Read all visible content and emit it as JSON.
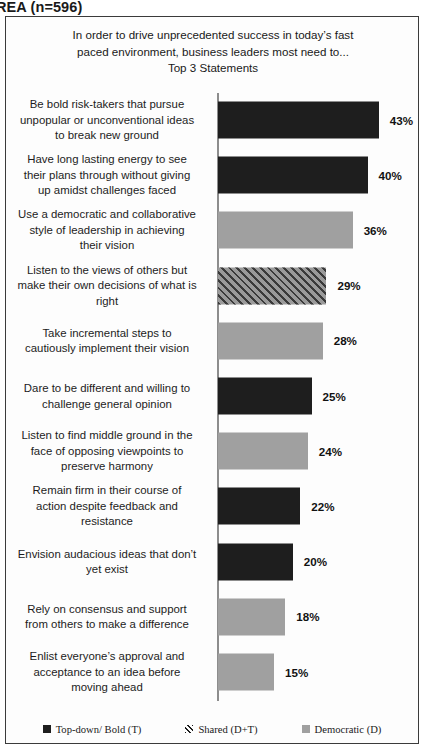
{
  "header": {
    "text": "REA (n=596)"
  },
  "chart_data": {
    "type": "bar",
    "orientation": "horizontal",
    "title_lines": [
      "In order to drive unprecedented success in today’s fast",
      "paced environment, business leaders most need to...",
      "Top 3 Statements"
    ],
    "xlabel": "",
    "ylabel": "",
    "xlim": [
      0,
      50
    ],
    "grid": false,
    "legend_position": "bottom",
    "value_suffix": "%",
    "categories": [
      "Be bold risk-takers  that pursue unpopular or unconventional ideas to break new ground",
      "Have long lasting energy to see their plans through without giving up amidst challenges faced",
      "Use a democratic and collaborative style of leadership  in achieving their vision",
      "Listen to the views of others but make their own decisions of what is right",
      "Take incremental steps to cautiously implement their vision",
      "Dare to be different and willing to challenge  general opinion",
      "Listen to find middle ground in the face of opposing viewpoints  to preserve harmony",
      "Remain firm in their course of action despite feedback and resistance",
      "Envision audacious ideas that don’t yet exist",
      "Rely on consensus and support from others to make a difference",
      "Enlist everyone’s approval and acceptance to an idea before moving ahead"
    ],
    "values": [
      43,
      40,
      36,
      29,
      28,
      25,
      24,
      22,
      20,
      18,
      15
    ],
    "value_labels": [
      "43%",
      "40%",
      "36%",
      "29%",
      "28%",
      "25%",
      "24%",
      "22%",
      "20%",
      "18%",
      "15%"
    ],
    "series_keys": [
      "topdown",
      "topdown",
      "democratic",
      "shared",
      "democratic",
      "topdown",
      "democratic",
      "topdown",
      "topdown",
      "democratic",
      "democratic"
    ],
    "bars": [
      {
        "label_lines": [
          "Be bold risk-takers  that pursue",
          "unpopular or unconventional ideas",
          "to break new ground"
        ],
        "value": 43,
        "value_label": "43%",
        "style": "topdown"
      },
      {
        "label_lines": [
          "Have long lasting energy to see",
          "their plans through without giving",
          "up amidst challenges faced"
        ],
        "value": 40,
        "value_label": "40%",
        "style": "topdown"
      },
      {
        "label_lines": [
          "Use a democratic and collaborative",
          "style of leadership  in achieving",
          "their vision"
        ],
        "value": 36,
        "value_label": "36%",
        "style": "democratic"
      },
      {
        "label_lines": [
          "Listen to the views of others but",
          "make their own decisions of what is",
          "right"
        ],
        "value": 29,
        "value_label": "29%",
        "style": "shared"
      },
      {
        "label_lines": [
          "Take incremental steps to",
          "cautiously implement their vision"
        ],
        "value": 28,
        "value_label": "28%",
        "style": "democratic"
      },
      {
        "label_lines": [
          "Dare to be different and willing to",
          "challenge  general opinion"
        ],
        "value": 25,
        "value_label": "25%",
        "style": "topdown"
      },
      {
        "label_lines": [
          "Listen to find middle ground in the",
          "face of opposing viewpoints  to",
          "preserve harmony"
        ],
        "value": 24,
        "value_label": "24%",
        "style": "democratic"
      },
      {
        "label_lines": [
          "Remain firm in their course of",
          "action despite feedback and",
          "resistance"
        ],
        "value": 22,
        "value_label": "22%",
        "style": "topdown"
      },
      {
        "label_lines": [
          "Envision audacious ideas that don’t",
          "yet exist"
        ],
        "value": 20,
        "value_label": "20%",
        "style": "topdown"
      },
      {
        "label_lines": [
          "Rely on consensus and support",
          "from others to make a difference"
        ],
        "value": 18,
        "value_label": "18%",
        "style": "democratic"
      },
      {
        "label_lines": [
          "Enlist everyone’s approval and",
          "acceptance to an idea before",
          "moving ahead"
        ],
        "value": 15,
        "value_label": "15%",
        "style": "democratic"
      }
    ],
    "legend": [
      {
        "label": "Top-down/ Bold (T)",
        "style": "topdown",
        "color": "#1e1e1e"
      },
      {
        "label": "Shared (D+T)",
        "style": "shared",
        "color": "#9a9a9a"
      },
      {
        "label": "Democratic (D)",
        "style": "democratic",
        "color": "#a0a0a0"
      }
    ]
  }
}
